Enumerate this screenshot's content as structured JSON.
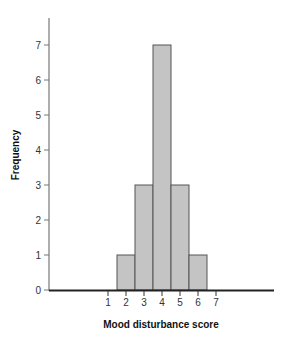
{
  "chart_data": {
    "type": "bar",
    "title": "",
    "xlabel": "Mood disturbance score",
    "ylabel": "Frequency",
    "categories": [
      "1",
      "2",
      "3",
      "4",
      "5",
      "6",
      "7"
    ],
    "values": [
      0,
      1,
      3,
      7,
      3,
      1,
      0
    ],
    "x_ticks": [
      "1",
      "2",
      "3",
      "4",
      "5",
      "6",
      "7"
    ],
    "y_ticks": [
      "0",
      "1",
      "2",
      "3",
      "4",
      "5",
      "6",
      "7"
    ],
    "ylim": [
      0,
      7.7
    ],
    "grid": false,
    "legend": null,
    "bar_color": "#c4c4c4",
    "bar_edge_color": "#555555"
  }
}
